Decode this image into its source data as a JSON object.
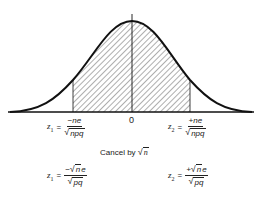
{
  "diagram": {
    "type": "normal-distribution-curve",
    "center_label": "0",
    "shaded_region": {
      "from": "z1",
      "to": "z2",
      "pattern": "diagonal-hatch"
    },
    "colors": {
      "curve": "#111111",
      "hatch": "#333333",
      "background": "#ffffff"
    }
  },
  "z1_first": {
    "lhs": "z",
    "sub": "1",
    "eq": "=",
    "numerator": "−ne",
    "radical_symbol": "√",
    "denominator": "npq"
  },
  "z2_first": {
    "lhs": "z",
    "sub": "2",
    "eq": "=",
    "numerator": "+ne",
    "radical_symbol": "√",
    "denominator": "npq"
  },
  "cancel": {
    "text": "Cancel by ",
    "radical_symbol": "√",
    "radicand": "n"
  },
  "z1_second": {
    "lhs": "z",
    "sub": "1",
    "eq": "=",
    "numerator_sign": "−",
    "radical_symbol": "√",
    "numerator_radicand": "n",
    "numerator_rest": "e",
    "numerator_rest_prefix": "n",
    "denominator": "pq"
  },
  "z2_second": {
    "lhs": "z",
    "sub": "2",
    "eq": "=",
    "numerator_sign": "+",
    "radical_symbol": "√",
    "numerator_radicand": "n",
    "numerator_rest": "e",
    "numerator_rest_prefix": "n",
    "denominator": "pq"
  }
}
